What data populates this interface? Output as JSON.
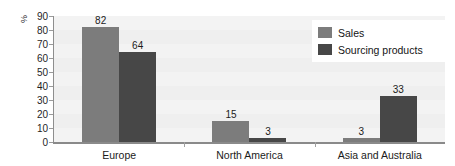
{
  "chart_data": {
    "type": "bar",
    "title": "",
    "xlabel": "",
    "ylabel": "%",
    "ylim": [
      0,
      90
    ],
    "ytick_step": 10,
    "yticks": [
      "90",
      "80",
      "70",
      "60",
      "50",
      "40",
      "30",
      "20",
      "10",
      "0"
    ],
    "grid": false,
    "legend_position": "top-right",
    "categories": [
      "Europe",
      "North America",
      "Asia and Australia"
    ],
    "series": [
      {
        "name": "Sales",
        "color": "#7c7c7c",
        "values": [
          82,
          15,
          3
        ]
      },
      {
        "name": "Sourcing products",
        "color": "#474747",
        "values": [
          64,
          3,
          33
        ]
      }
    ],
    "data_labels": [
      [
        "82",
        "64"
      ],
      [
        "15",
        "3"
      ],
      [
        "3",
        "33"
      ]
    ]
  },
  "colors": {
    "page_background": "#ffffff",
    "plot_background": "#f3f3f3",
    "axis_line": "#8a8a8a",
    "tick_text": "#1f1f1f",
    "series_sales": "#7c7c7c",
    "series_sourcing": "#474747",
    "legend_background": "#ffffff"
  },
  "legend": {
    "items": [
      {
        "label": "Sales",
        "swatch_class": "series-sales"
      },
      {
        "label": "Sourcing products",
        "swatch_class": "series-sourcing"
      }
    ]
  }
}
